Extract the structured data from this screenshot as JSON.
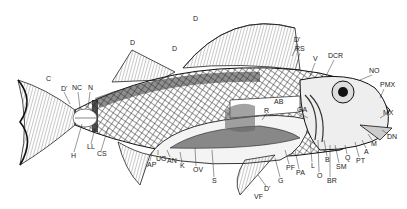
{
  "figure": {
    "ink_color": "#1a1a1a",
    "background": "#ffffff"
  },
  "labels": [
    {
      "id": "C",
      "text": "C",
      "x": 46,
      "y": 78
    },
    {
      "id": "D_prime_tail",
      "text": "D'",
      "x": 61,
      "y": 88
    },
    {
      "id": "NC",
      "text": "NC",
      "x": 73,
      "y": 87
    },
    {
      "id": "N",
      "text": "N",
      "x": 88,
      "y": 87
    },
    {
      "id": "H",
      "text": "H",
      "x": 72,
      "y": 155
    },
    {
      "id": "LL",
      "text": "LL",
      "x": 88,
      "y": 146
    },
    {
      "id": "CS",
      "text": "CS",
      "x": 98,
      "y": 153
    },
    {
      "id": "D_front",
      "text": "D",
      "x": 130,
      "y": 42
    },
    {
      "id": "D_mid",
      "text": "D",
      "x": 172,
      "y": 48
    },
    {
      "id": "D_top",
      "text": "D",
      "x": 193,
      "y": 18
    },
    {
      "id": "D_prime_dorsal",
      "text": "D'",
      "x": 294,
      "y": 39
    },
    {
      "id": "RS",
      "text": "RS",
      "x": 296,
      "y": 48
    },
    {
      "id": "V",
      "text": "V",
      "x": 313,
      "y": 58
    },
    {
      "id": "DCR",
      "text": "DCR",
      "x": 329,
      "y": 55
    },
    {
      "id": "NO",
      "text": "NO",
      "x": 369,
      "y": 70
    },
    {
      "id": "PMX",
      "text": "PMX",
      "x": 381,
      "y": 84
    },
    {
      "id": "MX",
      "text": "MX",
      "x": 383,
      "y": 112
    },
    {
      "id": "DN",
      "text": "DN",
      "x": 387,
      "y": 136
    },
    {
      "id": "AB",
      "text": "AB",
      "x": 275,
      "y": 101
    },
    {
      "id": "R",
      "text": "R",
      "x": 265,
      "y": 110
    },
    {
      "id": "GA",
      "text": "GA",
      "x": 297,
      "y": 109
    },
    {
      "id": "M",
      "text": "M",
      "x": 371,
      "y": 143
    },
    {
      "id": "A",
      "text": "A",
      "x": 364,
      "y": 151
    },
    {
      "id": "PT",
      "text": "PT",
      "x": 357,
      "y": 160
    },
    {
      "id": "Q",
      "text": "Q",
      "x": 345,
      "y": 157
    },
    {
      "id": "SM",
      "text": "SM",
      "x": 337,
      "y": 166
    },
    {
      "id": "B",
      "text": "B",
      "x": 325,
      "y": 159
    },
    {
      "id": "BR",
      "text": "BR",
      "x": 328,
      "y": 180
    },
    {
      "id": "O",
      "text": "O",
      "x": 317,
      "y": 175
    },
    {
      "id": "L",
      "text": "L",
      "x": 311,
      "y": 165
    },
    {
      "id": "PA",
      "text": "PA",
      "x": 297,
      "y": 172
    },
    {
      "id": "PF",
      "text": "PF",
      "x": 287,
      "y": 167
    },
    {
      "id": "G",
      "text": "G",
      "x": 278,
      "y": 180
    },
    {
      "id": "D_prime_ventral",
      "text": "D'",
      "x": 264,
      "y": 188
    },
    {
      "id": "VF",
      "text": "VF",
      "x": 255,
      "y": 196
    },
    {
      "id": "S",
      "text": "S",
      "x": 212,
      "y": 180
    },
    {
      "id": "OV",
      "text": "OV",
      "x": 194,
      "y": 169
    },
    {
      "id": "K",
      "text": "K",
      "x": 180,
      "y": 165
    },
    {
      "id": "AN",
      "text": "AN",
      "x": 168,
      "y": 160
    },
    {
      "id": "UG",
      "text": "UG",
      "x": 156,
      "y": 158
    },
    {
      "id": "AP",
      "text": "AP",
      "x": 148,
      "y": 164
    }
  ]
}
